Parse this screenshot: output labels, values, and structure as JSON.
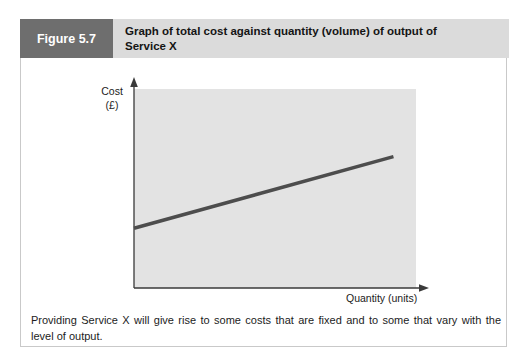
{
  "figure": {
    "label": "Figure 5.7",
    "title": "Graph of total cost against quantity (volume) of output of Service X",
    "caption": "Providing Service X will give rise to some costs that are fixed and to some that vary with the level of output."
  },
  "colors": {
    "figure_label_bg": "#6e6e6e",
    "title_bar_bg": "#dbdbdb",
    "plot_bg": "#e3e3e3",
    "axis": "#3a3a3a",
    "line": "#4d4d4d",
    "border": "#c9c9c9"
  },
  "chart_data": {
    "type": "line",
    "title": "Graph of total cost against quantity (volume) of output of Service X",
    "xlabel": "Quantity (units)",
    "ylabel": "Cost (£)",
    "ylabel_lines": [
      "Cost",
      "(£)"
    ],
    "x_range": [
      0,
      100
    ],
    "y_range": [
      0,
      100
    ],
    "grid": false,
    "tick_labels": "none",
    "series": [
      {
        "name": "Total cost",
        "points": [
          [
            0,
            30
          ],
          [
            92,
            66
          ]
        ],
        "color": "#4d4d4d",
        "stroke_width": 3.5
      }
    ],
    "annotation": "Straight line starting above zero on the cost axis (fixed cost) rising at a constant slope (variable cost)."
  }
}
